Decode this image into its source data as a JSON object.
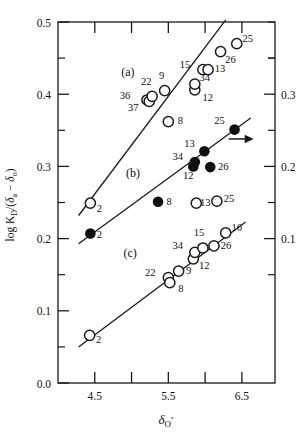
{
  "chart_data": {
    "type": "scatter",
    "title": "",
    "xlabel": "δO′",
    "ylabel": "log KD/(δa − δo)",
    "xlim": [
      4.0,
      6.95
    ],
    "ylim": [
      0.0,
      0.5
    ],
    "xticks": [
      4.5,
      5.5,
      6.5
    ],
    "xticks_minor": [
      5.0,
      6.0
    ],
    "yticks": [
      0.0,
      0.1,
      0.2,
      0.3,
      0.4,
      0.5
    ],
    "yticks_minor": [
      0.05,
      0.15,
      0.25,
      0.35,
      0.45
    ],
    "right_axis": {
      "label": "",
      "ticks": [
        0.1,
        0.2,
        0.3
      ],
      "ticks_minor": [
        0.05,
        0.15,
        0.25,
        0.35
      ],
      "tick_labels": [
        "0.1",
        "0.2",
        "0.3"
      ],
      "offset_note": "right scale shifted −0.1 relative to left scale"
    },
    "grid": false,
    "legend_position": "none",
    "series": [
      {
        "name": "(a)",
        "label": "(a)",
        "marker": "open-circle",
        "label_x": 4.95,
        "label_y": 0.425,
        "fit_line": {
          "x1": 4.28,
          "y1": 0.232,
          "x2": 6.28,
          "y2": 0.503
        },
        "points": [
          {
            "id": "2",
            "x": 4.44,
            "y": 0.249,
            "label_dx": 9,
            "label_dy": 9
          },
          {
            "id": "36",
            "x": 5.21,
            "y": 0.392,
            "label_dx": -22,
            "label_dy": -1
          },
          {
            "id": "37",
            "x": 5.24,
            "y": 0.39,
            "label_dx": -16,
            "label_dy": 10
          },
          {
            "id": "22",
            "x": 5.28,
            "y": 0.397,
            "label_dx": -6,
            "label_dy": -11
          },
          {
            "id": "9",
            "x": 5.45,
            "y": 0.405,
            "label_dx": -3,
            "label_dy": -12
          },
          {
            "id": "8",
            "x": 5.5,
            "y": 0.362,
            "label_dx": 12,
            "label_dy": 2
          },
          {
            "id": "12",
            "x": 5.86,
            "y": 0.406,
            "label_dx": 13,
            "label_dy": 11
          },
          {
            "id": "34",
            "x": 5.86,
            "y": 0.414,
            "label_dx": 10,
            "label_dy": -3
          },
          {
            "id": "15",
            "x": 5.97,
            "y": 0.434,
            "label_dx": -18,
            "label_dy": -2
          },
          {
            "id": "13",
            "x": 6.04,
            "y": 0.434,
            "label_dx": 12,
            "label_dy": 2
          },
          {
            "id": "26",
            "x": 6.21,
            "y": 0.459,
            "label_dx": 10,
            "label_dy": 11
          },
          {
            "id": "25",
            "x": 6.43,
            "y": 0.47,
            "label_dx": 11,
            "label_dy": -2
          }
        ]
      },
      {
        "name": "(b)",
        "label": "(b)",
        "marker": "filled-circle",
        "label_x": 5.02,
        "label_y": 0.285,
        "fit_line": {
          "x1": 4.28,
          "y1": 0.193,
          "x2": 6.62,
          "y2": 0.367
        },
        "points": [
          {
            "id": "2",
            "x": 4.44,
            "y": 0.207,
            "label_dx": 9,
            "label_dy": 4
          },
          {
            "id": "8",
            "x": 5.36,
            "y": 0.251,
            "label_dx": 11,
            "label_dy": 3
          },
          {
            "id": "12",
            "x": 5.84,
            "y": 0.3,
            "label_dx": -5,
            "label_dy": 13
          },
          {
            "id": "34",
            "x": 5.86,
            "y": 0.306,
            "label_dx": -17,
            "label_dy": -2
          },
          {
            "id": "13",
            "x": 5.99,
            "y": 0.321,
            "label_dx": -15,
            "label_dy": -4
          },
          {
            "id": "26",
            "x": 6.07,
            "y": 0.299,
            "label_dx": 13,
            "label_dy": 3
          },
          {
            "id": "25",
            "x": 6.4,
            "y": 0.351,
            "label_dx": -15,
            "label_dy": -6
          }
        ],
        "annotation": {
          "type": "arrow",
          "direction": "right",
          "x1": 6.32,
          "y1": 0.338,
          "x2": 6.66,
          "y2": 0.338
        }
      },
      {
        "name": "(b)-open-extra",
        "label": "",
        "marker": "open-circle",
        "fit_line": null,
        "points": [
          {
            "id": "13",
            "x": 5.88,
            "y": 0.249,
            "label_dx": 9,
            "label_dy": 3
          },
          {
            "id": "25",
            "x": 6.16,
            "y": 0.252,
            "label_dx": 12,
            "label_dy": 1
          }
        ]
      },
      {
        "name": "(c)",
        "label": "(c)",
        "marker": "open-circle",
        "label_x": 4.98,
        "label_y": 0.175,
        "fit_line": {
          "x1": 4.28,
          "y1": 0.05,
          "x2": 6.55,
          "y2": 0.223
        },
        "points": [
          {
            "id": "2",
            "x": 4.43,
            "y": 0.066,
            "label_dx": 9,
            "label_dy": 8
          },
          {
            "id": "22",
            "x": 5.5,
            "y": 0.146,
            "label_dx": -18,
            "label_dy": -2
          },
          {
            "id": "8",
            "x": 5.52,
            "y": 0.139,
            "label_dx": 11,
            "label_dy": 9
          },
          {
            "id": "9",
            "x": 5.64,
            "y": 0.155,
            "label_dx": 10,
            "label_dy": 3
          },
          {
            "id": "12",
            "x": 5.84,
            "y": 0.172,
            "label_dx": 11,
            "label_dy": 10
          },
          {
            "id": "34",
            "x": 5.86,
            "y": 0.181,
            "label_dx": -17,
            "label_dy": -3
          },
          {
            "id": "15",
            "x": 5.97,
            "y": 0.187,
            "label_dx": -4,
            "label_dy": -12
          },
          {
            "id": "26",
            "x": 6.12,
            "y": 0.19,
            "label_dx": 12,
            "label_dy": 3
          },
          {
            "id": "16",
            "x": 6.28,
            "y": 0.208,
            "label_dx": 11,
            "label_dy": -2
          }
        ]
      }
    ]
  },
  "colors": {
    "axis": "#1a1a1a",
    "marker_open_stroke": "#1a1a1a",
    "marker_filled": "#101010",
    "text": "#111111",
    "background": "#ffffff"
  }
}
